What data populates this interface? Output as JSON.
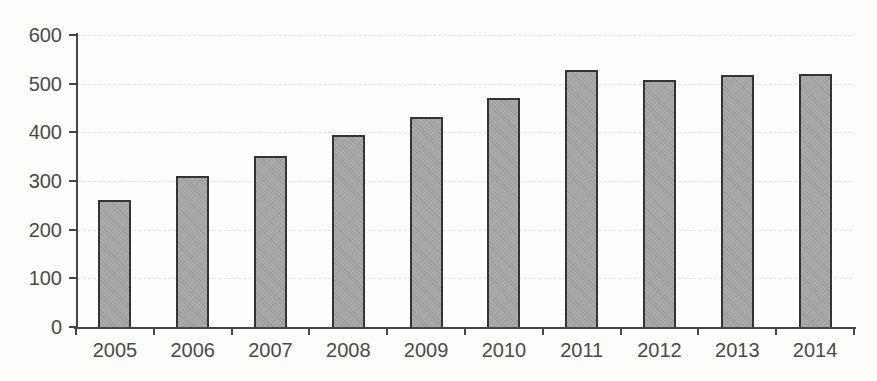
{
  "chart_data": {
    "type": "bar",
    "title": "",
    "xlabel": "",
    "ylabel": "",
    "categories": [
      "2005",
      "2006",
      "2007",
      "2008",
      "2009",
      "2010",
      "2011",
      "2012",
      "2013",
      "2014"
    ],
    "values": [
      260,
      310,
      352,
      395,
      432,
      470,
      528,
      507,
      518,
      520
    ],
    "ylim": [
      0,
      600
    ],
    "y_ticks": [
      0,
      100,
      200,
      300,
      400,
      500,
      600
    ],
    "grid": "horizontal-dashed",
    "legend_position": "none",
    "bar_fill_color": "#a9a8a5",
    "bar_border_color": "#343432",
    "axis_color": "#474644",
    "gridline_color": "#e2e1dd",
    "label_text_color": "#4a4a4a",
    "background_color": "#fdfdfc"
  }
}
